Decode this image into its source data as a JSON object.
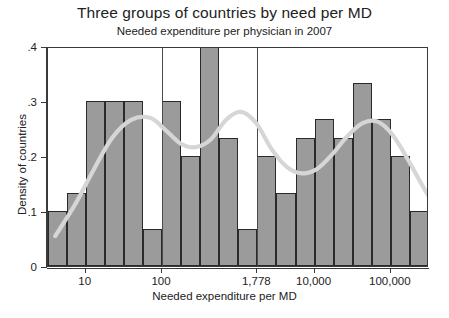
{
  "title": "Three groups of countries by need per MD",
  "subtitle": "Needed expenditure per physician in 2007",
  "colors": {
    "bar_fill": "#9b9b9b",
    "bar_border": "#2a2a2a",
    "curve": "#d6d6d6",
    "axis": "#3a3a3a",
    "refline": "#4a4a4a",
    "background": "#ffffff"
  },
  "axes": {
    "x": {
      "label": "Needed expenditure per MD",
      "scale": "log10",
      "ticks": [
        {
          "value": 10,
          "label": "10"
        },
        {
          "value": 100,
          "label": "100"
        },
        {
          "value": 1778,
          "label": "1,778"
        },
        {
          "value": 10000,
          "label": "10,000"
        },
        {
          "value": 100000,
          "label": "100,000"
        }
      ]
    },
    "y": {
      "label": "Density of countries",
      "ticks": [
        {
          "value": 0,
          "label": "0"
        },
        {
          "value": 0.1,
          "label": ".1"
        },
        {
          "value": 0.2,
          "label": ".2"
        },
        {
          "value": 0.3,
          "label": ".3"
        },
        {
          "value": 0.4,
          "label": ".4"
        }
      ]
    }
  },
  "chart_data": {
    "type": "bar",
    "title": "Three groups of countries by need per MD",
    "subtitle": "Needed expenditure per physician in 2007",
    "xlabel": "Needed expenditure per MD",
    "ylabel": "Density of countries",
    "xscale": "log10",
    "xlim": [
      3.2,
      316228
    ],
    "ylim": [
      0,
      0.4
    ],
    "grid": false,
    "legend": null,
    "xticks": [
      10,
      100,
      1778,
      10000,
      100000
    ],
    "xticklabels": [
      "10",
      "100",
      "1,778",
      "10,000",
      "100,000"
    ],
    "yticks": [
      0,
      0.1,
      0.2,
      0.3,
      0.4
    ],
    "yticklabels": [
      "0",
      ".1",
      ".2",
      ".3",
      ".4"
    ],
    "bar_count": 22,
    "bin_edges_log10": [
      0.5,
      0.75,
      1.0,
      1.25,
      1.5,
      1.75,
      2.0,
      2.25,
      2.5,
      2.75,
      3.0,
      3.25,
      3.5,
      3.75,
      4.0,
      4.25,
      4.5,
      4.75,
      5.0,
      5.25,
      5.5,
      5.75,
      6.0
    ],
    "values": [
      0.1,
      0.133,
      0.3,
      0.3,
      0.3,
      0.067,
      0.3,
      0.2,
      0.4,
      0.233,
      0.067,
      0.2,
      0.133,
      0.233,
      0.267,
      0.233,
      0.333,
      0.267,
      0.2,
      0.1,
      0.067,
      0.1
    ],
    "reference_lines": [
      {
        "value": 100,
        "label": "100"
      },
      {
        "value": 1778,
        "label": "1,778"
      }
    ],
    "density_curve": {
      "name": "kernel density",
      "color": "#d6d6d6",
      "points_log10_x": [
        0.6,
        0.85,
        1.1,
        1.35,
        1.6,
        1.85,
        2.05,
        2.25,
        2.45,
        2.65,
        2.85,
        3.05,
        3.25,
        3.45,
        3.65,
        3.85,
        4.05,
        4.25,
        4.45,
        4.65,
        4.85,
        5.05,
        5.25,
        5.45,
        5.65,
        5.85
      ],
      "points_y": [
        0.055,
        0.11,
        0.175,
        0.235,
        0.268,
        0.272,
        0.25,
        0.225,
        0.218,
        0.232,
        0.268,
        0.283,
        0.262,
        0.215,
        0.182,
        0.17,
        0.178,
        0.205,
        0.238,
        0.262,
        0.265,
        0.24,
        0.195,
        0.145,
        0.1,
        0.072
      ]
    }
  }
}
